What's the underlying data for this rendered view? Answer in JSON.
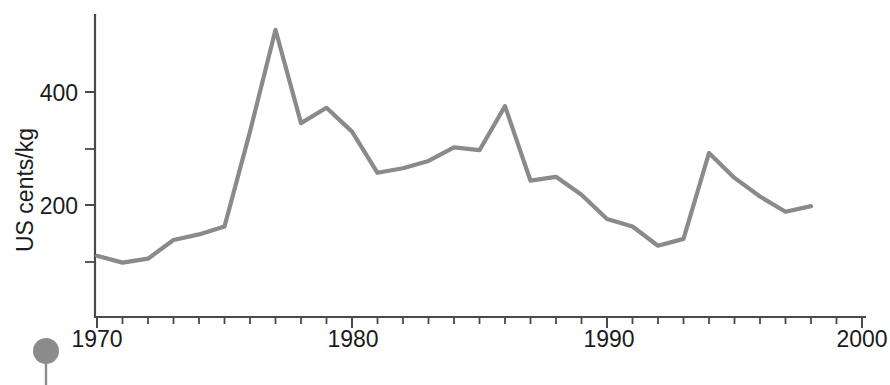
{
  "chart_data": {
    "type": "line",
    "title": "",
    "subtitle": "",
    "xlabel": "",
    "ylabel": "US cents/kg",
    "xlim": [
      1970,
      2000
    ],
    "ylim": [
      0,
      560
    ],
    "grid": false,
    "legend": null,
    "x_tick_labels": [
      "1970",
      "1980",
      "1990",
      "2000"
    ],
    "x_major_ticks": [
      1970,
      1980,
      1990,
      2000
    ],
    "x_minor_tick_interval": 1,
    "y_tick_labels": [
      "200",
      "400"
    ],
    "y_major_ticks": [
      200,
      400
    ],
    "y_minor_ticks": [
      100,
      300
    ],
    "line_color": "#8a8a8a",
    "axis_color": "#4a4a4a",
    "series": [
      {
        "name": "US cents/kg",
        "x": [
          1970,
          1971,
          1972,
          1973,
          1974,
          1975,
          1976,
          1977,
          1978,
          1979,
          1980,
          1981,
          1982,
          1983,
          1984,
          1985,
          1986,
          1987,
          1988,
          1989,
          1990,
          1991,
          1992,
          1993,
          1994,
          1995,
          1996,
          1997,
          1998
        ],
        "values": [
          110,
          98,
          105,
          138,
          148,
          162,
          330,
          510,
          345,
          372,
          330,
          257,
          265,
          278,
          302,
          297,
          375,
          243,
          250,
          218,
          175,
          162,
          128,
          140,
          292,
          248,
          215,
          188,
          198
        ]
      }
    ],
    "annotations": []
  },
  "marker": {
    "name": "pin-marker",
    "color": "#8c8c8c"
  },
  "axis": {
    "y_title": "US cents/kg",
    "y_labels": {
      "upper": "400",
      "lower": "200"
    },
    "x_labels": {
      "t1970": "1970",
      "t1980": "1980",
      "t1990": "1990",
      "t2000": "2000"
    }
  }
}
